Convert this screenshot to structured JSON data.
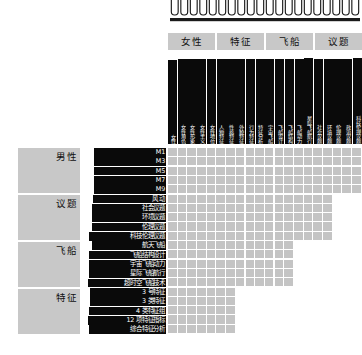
{
  "visualization": {
    "type": "clustered-similarity-matrix",
    "title": "",
    "colors": {
      "group_header_bg": "#c8c8c8",
      "group_header_text": "#101010",
      "label_bar_bg": "#0a0a0a",
      "label_bar_text": "#ffffff",
      "cell_fill": "#c4c4c4",
      "background": "#ffffff",
      "dendrogram_stroke": "#1a1a1a"
    }
  },
  "dendrogram": {
    "name": "column-dendrogram",
    "leaf_count": 20,
    "truncated": true
  },
  "columns": {
    "groups": [
      {
        "label": "女性",
        "span": 5
      },
      {
        "label": "特征",
        "span": 5
      },
      {
        "label": "飞船",
        "span": 5
      },
      {
        "label": "议题",
        "span": 5
      }
    ],
    "labels": [
      "女性",
      "女性角色",
      "女性形象",
      "女性主义",
      "女性地位",
      "人物特征",
      "性格特征",
      "外貌特征",
      "行为特征",
      "特征分析",
      "宇宙飞船",
      "飞船设计",
      "飞船结构",
      "飞船动力",
      "星际飞船航行",
      "社会议题",
      "环境议题",
      "伦理议题",
      "政治议题",
      "科技伦理议题"
    ]
  },
  "rows": {
    "groups": [
      {
        "label": "男性",
        "span": 5
      },
      {
        "label": "议题",
        "span": 5
      },
      {
        "label": "飞船",
        "span": 5
      },
      {
        "label": "特征",
        "span": 5
      }
    ],
    "labels": [
      "M1",
      "M3",
      "M5",
      "M7",
      "M9",
      "风 动",
      "社会议题",
      "环境议题",
      "伦理议题",
      "科技伦理议题",
      "航天飞船",
      "飞船结构设计",
      "宇宙飞船动力",
      "星际飞船航行",
      "超时空飞船技术",
      "3 号特征",
      "3 类特征",
      "4 类特征组",
      "12 项特征指标",
      "综合特征分析"
    ]
  },
  "matrix": {
    "name": "similarity-matrix",
    "rows": 20,
    "cols": 20,
    "shape": "lower-staircase",
    "row_widths": [
      20,
      20,
      20,
      20,
      20,
      17,
      17,
      17,
      17,
      17,
      13,
      13,
      13,
      13,
      13,
      7,
      7,
      7,
      7,
      7
    ]
  }
}
